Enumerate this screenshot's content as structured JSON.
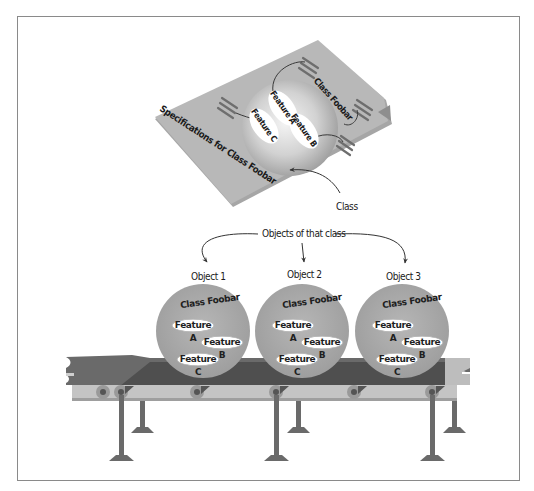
{
  "class_card": {
    "spec_label": "Specifications for Class Foobar",
    "class_name": "Class Foobar",
    "features": [
      "Feature A",
      "Feature B",
      "Feature C"
    ],
    "callout_label": "Class"
  },
  "objects_callout": {
    "label": "Objects of that class"
  },
  "objects": [
    {
      "label": "Object 1",
      "class_name": "Class Foobar",
      "features": [
        "Feature A",
        "Feature B",
        "Feature C"
      ]
    },
    {
      "label": "Object 2",
      "class_name": "Class Foobar",
      "features": [
        "Feature A",
        "Feature B",
        "Feature C"
      ]
    },
    {
      "label": "Object 3",
      "class_name": "Class Foobar",
      "features": [
        "Feature A",
        "Feature B",
        "Feature C"
      ]
    }
  ],
  "colors": {
    "card": "#b4b4b4",
    "card_edge": "#9a9a9a",
    "sphere": "#a8a8a8",
    "belt_dark": "#5e5e5e",
    "belt_light": "#c2c2c2",
    "frame_rail": "#9e9e9e",
    "leg": "#6a6a6a",
    "text": "#1a1a1a"
  }
}
